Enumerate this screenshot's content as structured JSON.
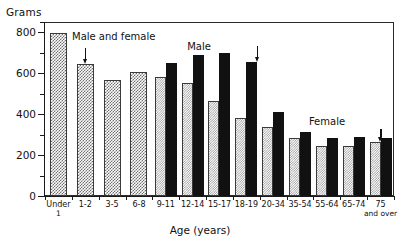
{
  "chart_data": {
    "type": "bar",
    "title": "",
    "xlabel": "Age (years)",
    "ylabel": "Grams",
    "ylim": [
      0,
      850
    ],
    "yticks": [
      0,
      200,
      400,
      600,
      800
    ],
    "ytick_labels": [
      "0",
      "200",
      "400",
      "600",
      "800"
    ],
    "yminor_ticks": [
      100,
      300,
      500,
      700
    ],
    "grid": false,
    "legend_position": "none",
    "categories": [
      "Under 1",
      "1-2",
      "3-5",
      "6-8",
      "9-11",
      "12-14",
      "15-17",
      "18-19",
      "20-34",
      "35-54",
      "55-64",
      "65-74",
      "75 and over"
    ],
    "category_labels": [
      {
        "main": "Under",
        "sub": "1"
      },
      {
        "main": "1-2",
        "sub": ""
      },
      {
        "main": "3-5",
        "sub": ""
      },
      {
        "main": "6-8",
        "sub": ""
      },
      {
        "main": "9-11",
        "sub": ""
      },
      {
        "main": "12-14",
        "sub": ""
      },
      {
        "main": "15-17",
        "sub": ""
      },
      {
        "main": "18-19",
        "sub": ""
      },
      {
        "main": "20-34",
        "sub": ""
      },
      {
        "main": "35-54",
        "sub": ""
      },
      {
        "main": "55-64",
        "sub": ""
      },
      {
        "main": "65-74",
        "sub": ""
      },
      {
        "main": "75",
        "sub": "and over"
      }
    ],
    "series": [
      {
        "name": "Male and female",
        "pattern": "checker",
        "values": [
          795,
          645,
          565,
          605,
          null,
          null,
          null,
          null,
          null,
          null,
          null,
          null,
          null
        ]
      },
      {
        "name": "Female",
        "pattern": "stipple",
        "values": [
          null,
          null,
          null,
          null,
          580,
          550,
          465,
          380,
          335,
          285,
          245,
          245,
          265
        ]
      },
      {
        "name": "Male",
        "pattern": "solid",
        "values": [
          null,
          null,
          null,
          null,
          650,
          690,
          700,
          655,
          410,
          315,
          285,
          290,
          285
        ]
      }
    ],
    "annotations": [
      {
        "text": "Male and female",
        "target_category": "1-2",
        "series": "Male and female"
      },
      {
        "text": "Male",
        "target_category": "18-19",
        "series": "Male"
      },
      {
        "text": "Female",
        "target_category": "75 and over",
        "series": "Female"
      }
    ]
  }
}
